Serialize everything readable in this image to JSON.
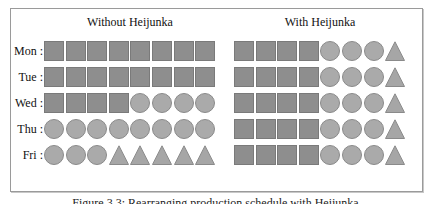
{
  "diagram": {
    "left_panel": {
      "title": "Without Heijunka",
      "rows": [
        {
          "label": "Mon :",
          "shapes": [
            "square",
            "square",
            "square",
            "square",
            "square",
            "square",
            "square",
            "square"
          ]
        },
        {
          "label": "Tue :",
          "shapes": [
            "square",
            "square",
            "square",
            "square",
            "square",
            "square",
            "square",
            "square"
          ]
        },
        {
          "label": "Wed :",
          "shapes": [
            "square",
            "square",
            "square",
            "square",
            "circle",
            "circle",
            "circle",
            "circle"
          ]
        },
        {
          "label": "Thu :",
          "shapes": [
            "circle",
            "circle",
            "circle",
            "circle",
            "circle",
            "circle",
            "circle",
            "circle"
          ]
        },
        {
          "label": "Fri :",
          "shapes": [
            "circle",
            "circle",
            "circle",
            "triangle",
            "triangle",
            "triangle",
            "triangle",
            "triangle"
          ]
        }
      ]
    },
    "right_panel": {
      "title": "With Heijunka",
      "rows": [
        {
          "shapes": [
            "square",
            "square",
            "square",
            "square",
            "circle",
            "circle",
            "circle",
            "triangle"
          ]
        },
        {
          "shapes": [
            "square",
            "square",
            "square",
            "square",
            "circle",
            "circle",
            "circle",
            "triangle"
          ]
        },
        {
          "shapes": [
            "square",
            "square",
            "square",
            "square",
            "circle",
            "circle",
            "circle",
            "triangle"
          ]
        },
        {
          "shapes": [
            "square",
            "square",
            "square",
            "square",
            "circle",
            "circle",
            "circle",
            "triangle"
          ]
        },
        {
          "shapes": [
            "square",
            "square",
            "square",
            "square",
            "circle",
            "circle",
            "circle",
            "triangle"
          ]
        }
      ]
    },
    "caption": "Figure 3.3: Rearranging production schedule with Heijunka",
    "colors": {
      "square": "#8e8e8e",
      "circle": "#aaaaaa",
      "triangle": "#a6a6a6",
      "border": "#9a9a9a"
    }
  }
}
